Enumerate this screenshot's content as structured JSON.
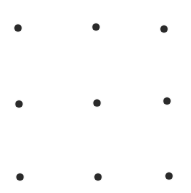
{
  "canvas": {
    "width": 191,
    "height": 193,
    "background": "#ffffff"
  },
  "dot_color": "#2a2a2a",
  "grid": {
    "rows": 3,
    "cols": 3
  },
  "dots": [
    {
      "row": 0,
      "col": 0,
      "x": 18,
      "y": 28
    },
    {
      "row": 0,
      "col": 1,
      "x": 96,
      "y": 27
    },
    {
      "row": 0,
      "col": 2,
      "x": 164,
      "y": 29
    },
    {
      "row": 1,
      "col": 0,
      "x": 19,
      "y": 104
    },
    {
      "row": 1,
      "col": 1,
      "x": 97,
      "y": 103
    },
    {
      "row": 1,
      "col": 2,
      "x": 167,
      "y": 101
    },
    {
      "row": 2,
      "col": 0,
      "x": 20,
      "y": 177
    },
    {
      "row": 2,
      "col": 1,
      "x": 98,
      "y": 177
    },
    {
      "row": 2,
      "col": 2,
      "x": 169,
      "y": 176
    }
  ]
}
